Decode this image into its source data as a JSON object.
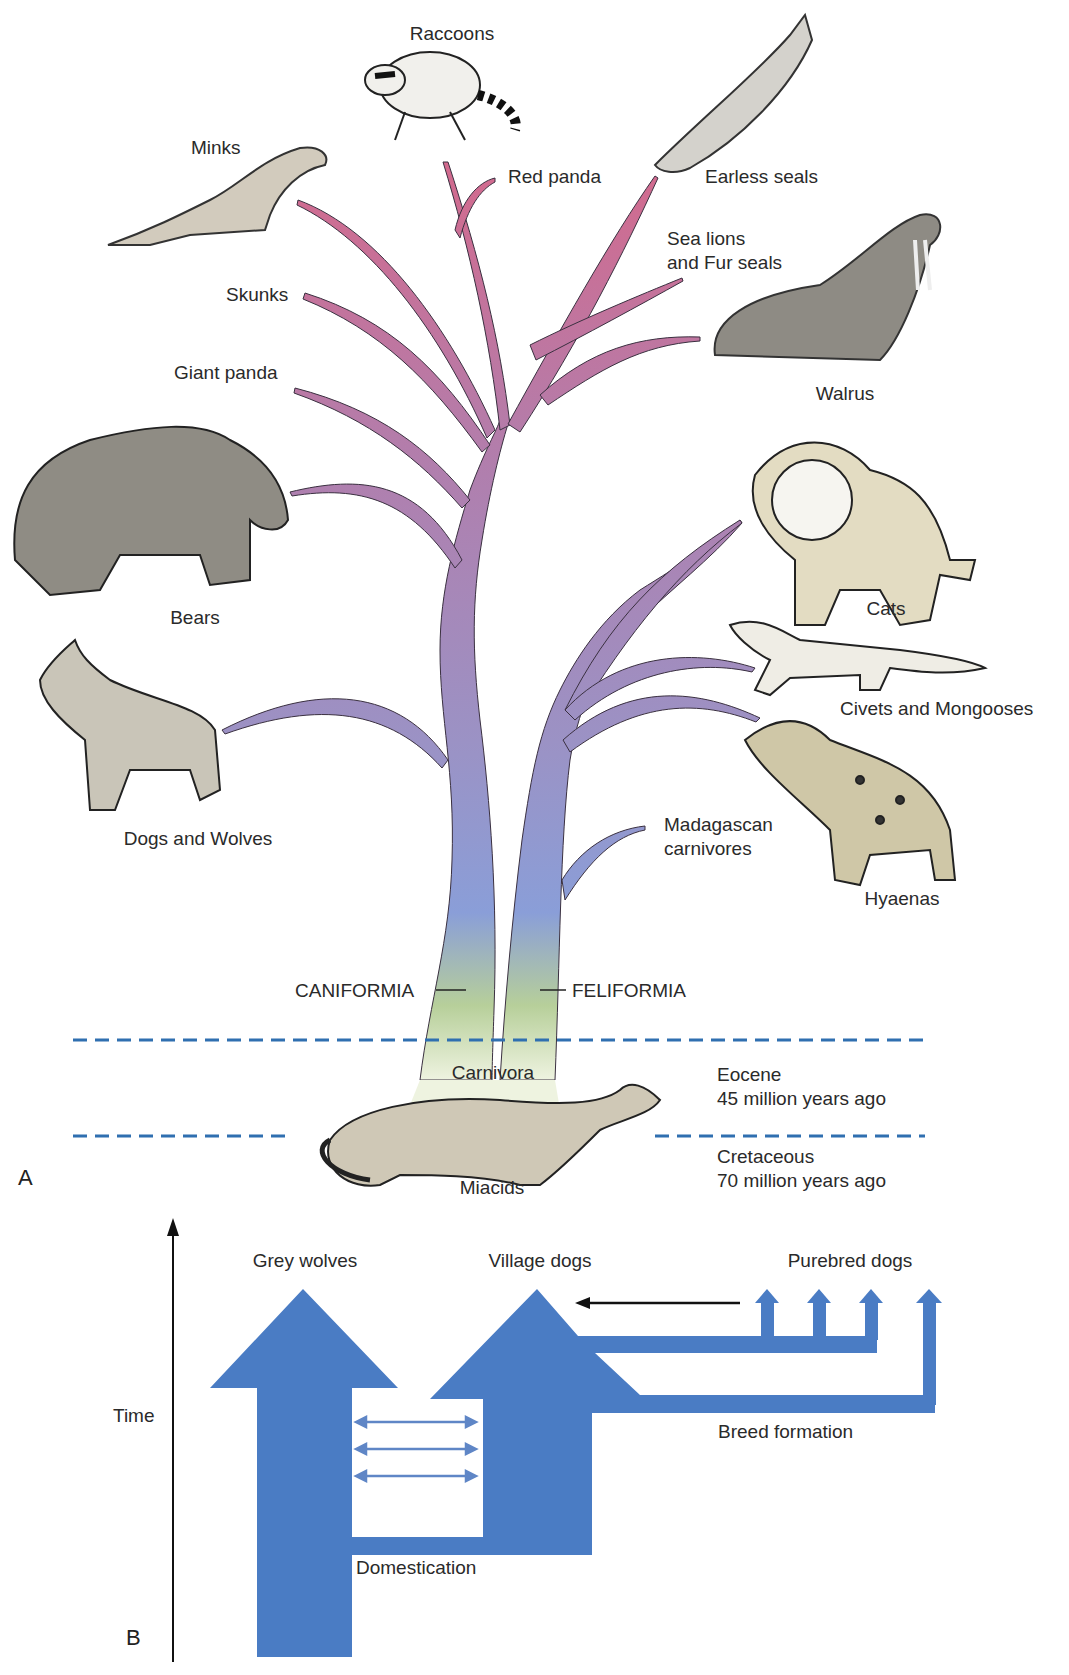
{
  "panel_a": {
    "letter": "A",
    "taxa": {
      "raccoons": "Raccoons",
      "red_panda": "Red panda",
      "earless_seals": "Earless seals",
      "minks": "Minks",
      "sea_lions_line1": "Sea lions",
      "sea_lions_line2": "and Fur seals",
      "skunks": "Skunks",
      "walrus": "Walrus",
      "giant_panda": "Giant panda",
      "bears": "Bears",
      "cats": "Cats",
      "civets": "Civets and Mongooses",
      "dogs_wolves": "Dogs and Wolves",
      "madagascan_line1": "Madagascan",
      "madagascan_line2": "carnivores",
      "hyaenas": "Hyaenas"
    },
    "clades": {
      "caniformia": "CANIFORMIA",
      "feliformia": "FELIFORMIA",
      "carnivora": "Carnivora",
      "miacids": "Miacids"
    },
    "time_periods": [
      {
        "epoch": "Eocene",
        "age": "45 million years ago"
      },
      {
        "epoch": "Cretaceous",
        "age": "70 million years ago"
      }
    ],
    "colors": {
      "tree_top": "#d0708f",
      "tree_mid": "#9c8cc0",
      "tree_low": "#8c9fd8",
      "tree_base": "#c8dc8c",
      "dash_line": "#2f6fb0",
      "animal_fill": "#c9c4b4"
    }
  },
  "panel_b": {
    "letter": "B",
    "axis_label": "Time",
    "groups": {
      "grey_wolves": "Grey wolves",
      "village_dogs": "Village dogs",
      "purebred_dogs": "Purebred dogs"
    },
    "events": {
      "domestication": "Domestication",
      "breed_formation": "Breed formation"
    },
    "colors": {
      "arrow_fill": "#4a7cc4",
      "gene_flow": "#5f86c6"
    }
  }
}
